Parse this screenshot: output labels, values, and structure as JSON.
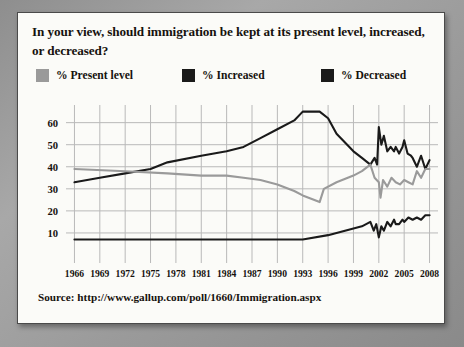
{
  "card": {
    "title": "In your view, should immigration be kept at its present level, increased, or decreased?",
    "source": "Source: http://www.gallup.com/poll/1660/Immigration.aspx"
  },
  "legend": {
    "items": [
      {
        "label": "% Present level",
        "color": "#9a9a9a",
        "swatch_name": "legend-swatch-present-level"
      },
      {
        "label": "% Increased",
        "color": "#1a1a1a",
        "swatch_name": "legend-swatch-increased"
      },
      {
        "label": "% Decreased",
        "color": "#1a1a1a",
        "swatch_name": "legend-swatch-decreased"
      }
    ]
  },
  "chart_data": {
    "type": "line",
    "title": "In your view, should immigration be kept at its present level, increased, or decreased?",
    "xlabel": "",
    "ylabel": "",
    "grid": true,
    "legend_position": "top",
    "xlim": [
      1965,
      2009
    ],
    "ylim": [
      0,
      68
    ],
    "yticks": [
      10,
      20,
      30,
      40,
      50,
      60
    ],
    "xticks": [
      1966,
      1969,
      1972,
      1975,
      1978,
      1981,
      1984,
      1987,
      1990,
      1993,
      1996,
      1999,
      2002,
      2005,
      2008
    ],
    "colors": {
      "present_level": "#9a9a9a",
      "increased": "#1a1a1a",
      "decreased": "#1a1a1a"
    },
    "series": [
      {
        "name": "% Decreased",
        "color": "#1a1a1a",
        "points": [
          [
            1966,
            33
          ],
          [
            1969,
            35
          ],
          [
            1972,
            37
          ],
          [
            1975,
            39
          ],
          [
            1977,
            42
          ],
          [
            1981,
            45
          ],
          [
            1984,
            47
          ],
          [
            1986,
            49
          ],
          [
            1988,
            53
          ],
          [
            1990,
            57
          ],
          [
            1992,
            61
          ],
          [
            1993,
            65
          ],
          [
            1995,
            65
          ],
          [
            1996,
            62
          ],
          [
            1997,
            55
          ],
          [
            1999,
            47
          ],
          [
            2000,
            44
          ],
          [
            2001,
            41
          ],
          [
            2001.5,
            44
          ],
          [
            2001.8,
            41
          ],
          [
            2002,
            58
          ],
          [
            2002.3,
            50
          ],
          [
            2002.6,
            54
          ],
          [
            2003,
            47
          ],
          [
            2003.4,
            49
          ],
          [
            2003.8,
            47
          ],
          [
            2004,
            49
          ],
          [
            2004.4,
            46
          ],
          [
            2004.8,
            49
          ],
          [
            2005,
            52
          ],
          [
            2005.4,
            46
          ],
          [
            2005.8,
            45
          ],
          [
            2006,
            44
          ],
          [
            2006.5,
            40
          ],
          [
            2007,
            45
          ],
          [
            2007.5,
            39
          ],
          [
            2008,
            43
          ]
        ]
      },
      {
        "name": "% Present level",
        "color": "#9a9a9a",
        "points": [
          [
            1966,
            39
          ],
          [
            1972,
            38
          ],
          [
            1977,
            37
          ],
          [
            1981,
            36
          ],
          [
            1984,
            36
          ],
          [
            1986,
            35
          ],
          [
            1988,
            34
          ],
          [
            1990,
            32
          ],
          [
            1992,
            29
          ],
          [
            1993,
            27
          ],
          [
            1995,
            24
          ],
          [
            1995.5,
            30
          ],
          [
            1997,
            33
          ],
          [
            1999,
            36
          ],
          [
            2000,
            38
          ],
          [
            2001,
            41
          ],
          [
            2001.5,
            35
          ],
          [
            2002,
            33
          ],
          [
            2002.2,
            26
          ],
          [
            2002.5,
            34
          ],
          [
            2003,
            31
          ],
          [
            2003.5,
            35
          ],
          [
            2004,
            33
          ],
          [
            2004.5,
            32
          ],
          [
            2005,
            34
          ],
          [
            2005.5,
            33
          ],
          [
            2006,
            32
          ],
          [
            2006.5,
            38
          ],
          [
            2007,
            35
          ],
          [
            2007.5,
            39
          ],
          [
            2008,
            39
          ]
        ]
      },
      {
        "name": "% Increased",
        "color": "#1a1a1a",
        "points": [
          [
            1966,
            7
          ],
          [
            1975,
            7
          ],
          [
            1984,
            7
          ],
          [
            1990,
            7
          ],
          [
            1993,
            7
          ],
          [
            1996,
            9
          ],
          [
            1998,
            11
          ],
          [
            1999,
            12
          ],
          [
            2000,
            13
          ],
          [
            2001,
            15
          ],
          [
            2001.4,
            11
          ],
          [
            2001.7,
            14
          ],
          [
            2002,
            8
          ],
          [
            2002.3,
            13
          ],
          [
            2002.6,
            11
          ],
          [
            2003,
            15
          ],
          [
            2003.4,
            13
          ],
          [
            2003.8,
            16
          ],
          [
            2004,
            14
          ],
          [
            2004.4,
            14
          ],
          [
            2004.8,
            16
          ],
          [
            2005,
            15
          ],
          [
            2005.5,
            17
          ],
          [
            2006,
            16
          ],
          [
            2006.5,
            17
          ],
          [
            2007,
            16
          ],
          [
            2007.5,
            18
          ],
          [
            2008,
            18
          ]
        ]
      }
    ]
  }
}
